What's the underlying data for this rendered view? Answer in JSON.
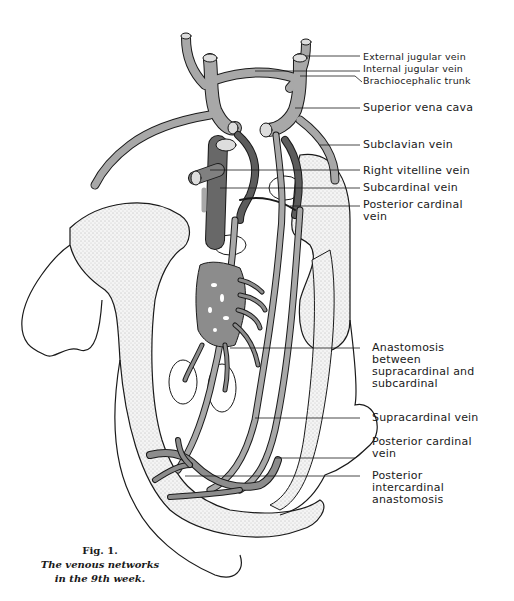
{
  "figure": {
    "number": "Fig. 1.",
    "caption_line1": "The venous networks",
    "caption_line2": "in the 9th week."
  },
  "labels": [
    {
      "id": "external-jugular-vein",
      "text": "External jugular vein"
    },
    {
      "id": "internal-jugular-vein",
      "text": "Internal jugular vein"
    },
    {
      "id": "brachiocephalic-trunk",
      "text": "Brachiocephalic trunk"
    },
    {
      "id": "superior-vena-cava",
      "text": "Superior vena cava"
    },
    {
      "id": "subclavian-vein",
      "text": "Subclavian vein"
    },
    {
      "id": "right-vitelline-vein",
      "text": "Right vitelline vein"
    },
    {
      "id": "subcardinal-vein",
      "text": "Subcardinal vein"
    },
    {
      "id": "posterior-cardinal-vein-upper",
      "text": "Posterior cardinal",
      "text2": "vein"
    },
    {
      "id": "anastomosis-supra-sub",
      "text": "Anastomosis",
      "text2": "between",
      "text3": "supracardinal and",
      "text4": "subcardinal"
    },
    {
      "id": "supracardinal-vein",
      "text": "Supracardinal vein"
    },
    {
      "id": "posterior-cardinal-vein-lower",
      "text": "Posterior cardinal",
      "text2": "vein"
    },
    {
      "id": "posterior-intercardinal-anastomosis",
      "text": "Posterior",
      "text2": "intercardinal",
      "text3": "anastomosis"
    }
  ],
  "colors": {
    "vein_light": "#a8a8a8",
    "vein_dark": "#5c5c5c",
    "stipple": "#e2e2e2",
    "outline": "#1a1a1a"
  }
}
